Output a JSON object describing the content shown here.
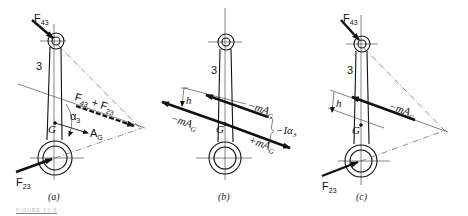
{
  "figure": {
    "caption_partial": "FIGURE 13-5",
    "panels": [
      {
        "id": "a",
        "caption": "(a)",
        "link_label": "3",
        "labels": {
          "F43": "F",
          "F43_sub": "43",
          "F23": "F",
          "F23_sub": "23",
          "sum": "F",
          "sum_sub1": "43",
          "sum_plus": " + F",
          "sum_sub2": "23",
          "G": "G",
          "alpha": "α",
          "alpha_sub": "3",
          "AG": "A",
          "AG_sub": "G"
        }
      },
      {
        "id": "b",
        "caption": "(b)",
        "link_label": "3",
        "labels": {
          "h": "h",
          "neg_mAG_top": "−mA",
          "neg_mAG_top_sub": "G",
          "neg_mAG_left": "−mA",
          "neg_mAG_left_sub": "G",
          "pos_mAG": "+mA",
          "pos_mAG_sub": "G",
          "I_alpha": "−Iα",
          "I_alpha_sub": "3",
          "G": "G"
        }
      },
      {
        "id": "c",
        "caption": "(c)",
        "link_label": "3",
        "labels": {
          "F43": "F",
          "F43_sub": "43",
          "F23": "F",
          "F23_sub": "23",
          "h": "h",
          "neg_mAG": "−mA",
          "neg_mAG_sub": "G",
          "G": "G"
        }
      }
    ]
  }
}
